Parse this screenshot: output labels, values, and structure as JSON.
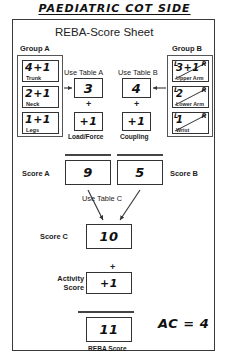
{
  "page": {
    "handwritten_title": "PAEDIATRIC COT SIDE",
    "sheet_title": "REBA-Score Sheet"
  },
  "group_a": {
    "label": "Group A",
    "use_table_label": "Use Table A",
    "parts": [
      {
        "name": "Trunk",
        "value": "4+1"
      },
      {
        "name": "Neck",
        "value": "2+1"
      },
      {
        "name": "Legs",
        "value": "1+1"
      }
    ],
    "table_result": "3",
    "load_force": {
      "label": "Load/Force",
      "value": "+1"
    },
    "plus": "+",
    "score_label": "Score A",
    "score_value": "9"
  },
  "group_b": {
    "label": "Group B",
    "use_table_label": "Use Table B",
    "left_marker": "L",
    "right_marker": "R",
    "parts": [
      {
        "name": "Upper Arm",
        "value": "3+1"
      },
      {
        "name": "Lower Arm",
        "value": "2"
      },
      {
        "name": "Wrist",
        "value": "1"
      }
    ],
    "table_result": "4",
    "coupling": {
      "label": "Coupling",
      "value": "+1"
    },
    "plus": "+",
    "score_label": "Score B",
    "score_value": "5"
  },
  "score_c": {
    "use_table_label": "Use Table C",
    "label": "Score C",
    "value": "10"
  },
  "activity": {
    "label": "Activity\nScore",
    "label_line1": "Activity",
    "label_line2": "Score",
    "value": "+1",
    "plus": "+"
  },
  "reba": {
    "label": "REBA Score",
    "value": "11"
  },
  "annotation": {
    "action_category": "AC = 4"
  },
  "colors": {
    "ink": "#111111",
    "frame": "#3a3a3a",
    "box_border": "#333333",
    "background": "#ffffff"
  }
}
